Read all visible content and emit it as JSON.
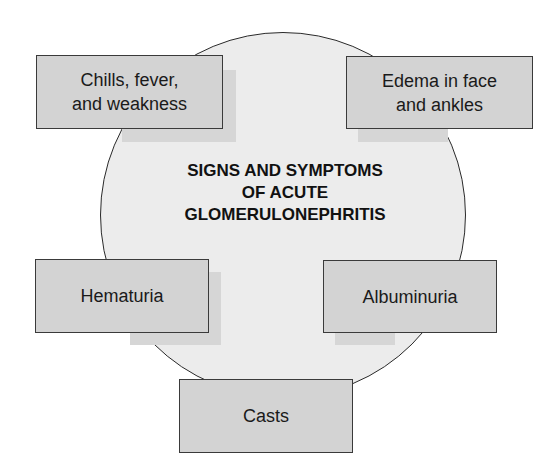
{
  "diagram": {
    "title_lines": [
      "SIGNS AND SYMPTOMS",
      "OF ACUTE",
      "GLOMERULONEPHRITIS"
    ],
    "boxes": [
      {
        "id": "chills",
        "lines": [
          "Chills, fever,",
          "and weakness"
        ]
      },
      {
        "id": "edema",
        "lines": [
          "Edema in face",
          "and ankles"
        ]
      },
      {
        "id": "hematuria",
        "lines": [
          "Hematuria"
        ]
      },
      {
        "id": "albuminuria",
        "lines": [
          "Albuminuria"
        ]
      },
      {
        "id": "casts",
        "lines": [
          "Casts"
        ]
      }
    ],
    "colors": {
      "circle_fill": "#ececec",
      "box_fill": "#d3d3d3",
      "shadow": "#d6d6d6",
      "outline": "#2a2a2a"
    }
  }
}
